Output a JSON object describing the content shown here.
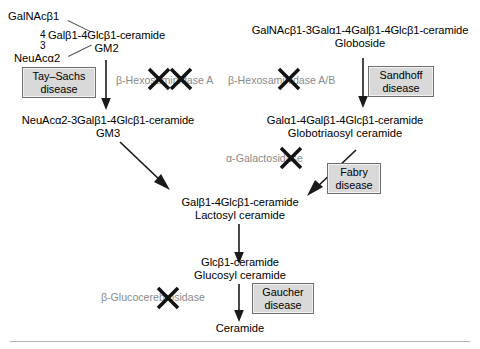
{
  "diagram": {
    "nodes": {
      "gm2_branch_top": "GalNAcβ1",
      "gm2_branch_bottom": "NeuAcα2",
      "gm2_num_top": "4",
      "gm2_num_bottom": "3",
      "gm2_chem": "Galβ1-4Glcβ1-ceramide",
      "gm2_common": "GM2",
      "globoside_chem": "GalNAcβ1-3Galα1-4Galβ1-4Glcβ1-ceramide",
      "globoside_common": "Globoside",
      "gm3_chem": "NeuAcα2-3Galβ1-4Glcβ1-ceramide",
      "gm3_common": "GM3",
      "gb3_chem": "Galα1-4Galβ1-4Glcβ1-ceramide",
      "gb3_common": "Globotriaosyl ceramide",
      "lactosyl_chem": "Galβ1-4Glcβ1-ceramide",
      "lactosyl_common": "Lactosyl ceramide",
      "glucosyl_chem": "Glcβ1-ceramide",
      "glucosyl_common": "Glucosyl ceramide",
      "ceramide_common": "Ceramide"
    },
    "enzymes": {
      "hexosaminidase_a": "β-Hexosaminidase A",
      "hexosaminidase_ab": "β-Hexosaminidase A/B",
      "alpha_galactosidase": "α-Galactosidase",
      "glucocerebrosidase": "β-Glucocerebrosidase"
    },
    "diseases": {
      "tay_sachs": "Tay–Sachs\ndisease",
      "tay_sachs_line1": "Tay–Sachs",
      "tay_sachs_line2": "disease",
      "sandhoff_line1": "Sandhoff",
      "sandhoff_line2": "disease",
      "fabry_line1": "Fabry",
      "fabry_line2": "disease",
      "gaucher_line1": "Gaucher",
      "gaucher_line2": "disease"
    },
    "colors": {
      "text": "#000000",
      "enzyme_text": "#8a8a8a",
      "disease_fill": "#d9d9d9",
      "disease_border": "#6e6e6e",
      "arrow": "#1a1a1a",
      "rule": "#b5b5b5"
    }
  }
}
